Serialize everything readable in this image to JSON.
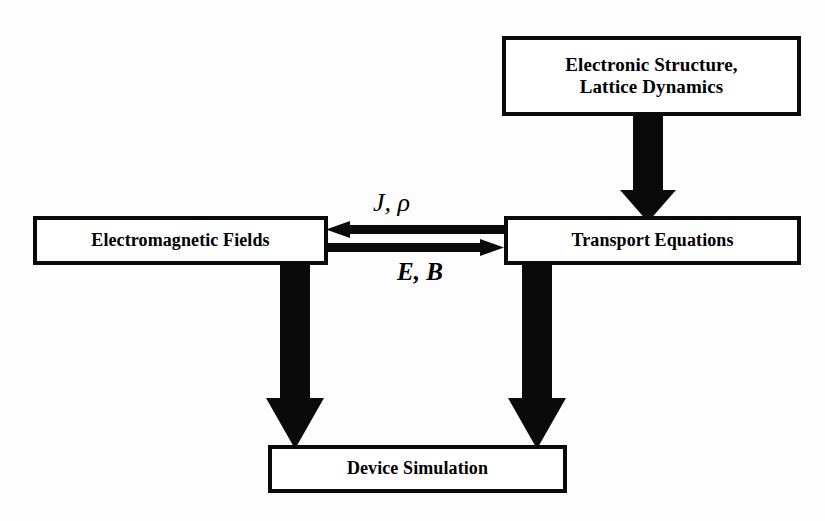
{
  "diagram": {
    "background_color": "#fdfdfd",
    "stroke_color": "#0a0a0a",
    "fill_color": "#ffffff",
    "nodes": [
      {
        "id": "electronic-structure",
        "label": "Electronic Structure,\nLattice Dynamics",
        "shape": "rectangle"
      },
      {
        "id": "electromagnetic-fields",
        "label": "Electromagnetic Fields",
        "shape": "rectangle"
      },
      {
        "id": "transport-equations",
        "label": "Transport Equations",
        "shape": "rectangle"
      },
      {
        "id": "device-simulation",
        "label": "Device Simulation",
        "shape": "rectangle"
      }
    ],
    "edges": [
      {
        "id": "es-to-te",
        "from": "electronic-structure",
        "to": "transport-equations",
        "direction": "down",
        "label": ""
      },
      {
        "id": "te-to-emf",
        "from": "transport-equations",
        "to": "electromagnetic-fields",
        "direction": "left",
        "label": "J, ρ"
      },
      {
        "id": "emf-to-te",
        "from": "electromagnetic-fields",
        "to": "transport-equations",
        "direction": "right",
        "label": "E, B"
      },
      {
        "id": "emf-to-ds",
        "from": "electromagnetic-fields",
        "to": "device-simulation",
        "direction": "down",
        "label": ""
      },
      {
        "id": "te-to-ds",
        "from": "transport-equations",
        "to": "device-simulation",
        "direction": "down",
        "label": ""
      }
    ]
  }
}
